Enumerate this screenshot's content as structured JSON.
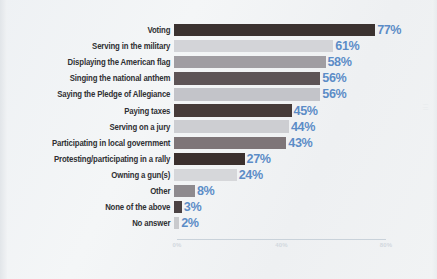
{
  "chart_data": {
    "type": "bar",
    "orientation": "horizontal",
    "title": "",
    "xlabel": "",
    "ylabel": "",
    "xlim": [
      0,
      80
    ],
    "grid": false,
    "legend": false,
    "axis_ticks": [
      "0%",
      "40%",
      "80%"
    ],
    "axis_tick_values": [
      0,
      40,
      80
    ],
    "value_suffix": "%",
    "categories": [
      "Voting",
      "Serving in the military",
      "Displaying the American flag",
      "Singing the national anthem",
      "Saying the Pledge of Allegiance",
      "Paying taxes",
      "Serving on a jury",
      "Participating in local government",
      "Protesting/participating in a rally",
      "Owning a gun(s)",
      "Other",
      "None of the above",
      "No answer"
    ],
    "values": [
      77,
      61,
      58,
      56,
      56,
      45,
      44,
      43,
      27,
      24,
      8,
      3,
      2
    ],
    "value_labels": [
      "77%",
      "61%",
      "58%",
      "56%",
      "56%",
      "45%",
      "44%",
      "43%",
      "27%",
      "24%",
      "8%",
      "3%",
      "2%"
    ],
    "bar_colors": [
      "#3b3230",
      "#d3d4d8",
      "#a09da2",
      "#5d5456",
      "#c3c4c9",
      "#463b39",
      "#cdced2",
      "#7e7578",
      "#3b302e",
      "#d6d7da",
      "#8e8a8e",
      "#4b4244",
      "#c9cacd"
    ]
  },
  "style": {
    "value_color": "#5c8cc6",
    "label_color": "#2f3033",
    "background": "#f1f3f4",
    "axis_color": "#c9d2da",
    "tick_color": "#d2d8de"
  },
  "watermark": "|||"
}
